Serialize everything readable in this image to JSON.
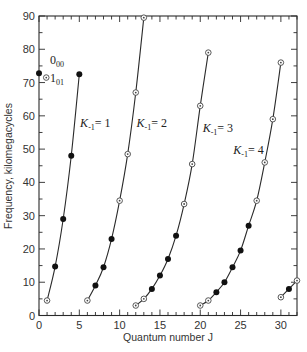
{
  "chart_data": {
    "type": "line",
    "title": "",
    "xlabel": "Quantum number J",
    "ylabel": "Frequency, kilomegacycles",
    "xlim": [
      0,
      32
    ],
    "ylim": [
      0,
      90
    ],
    "grid": false,
    "x_ticks": [
      0,
      5,
      10,
      15,
      20,
      25,
      30
    ],
    "y_ticks": [
      0,
      10,
      20,
      30,
      40,
      50,
      60,
      70,
      80,
      90
    ],
    "marker_legend": {
      "filled": "filled circle",
      "open": "open (dotted) circle"
    },
    "annotations": [
      {
        "text": "0",
        "sub": "00",
        "x": 0,
        "y": 72.8,
        "marker": "filled"
      },
      {
        "text": "1",
        "sub": "01",
        "x": 0.9,
        "y": 71.5,
        "marker": "open"
      }
    ],
    "series": [
      {
        "name": "K_-1 = 1",
        "label_base": "K",
        "label_sub": "-1",
        "label_value": "= 1",
        "label_pos": [
          5.1,
          56.5
        ],
        "points": [
          {
            "x": 1,
            "y": 4.5,
            "m": "open"
          },
          {
            "x": 2,
            "y": 14.7,
            "m": "filled"
          },
          {
            "x": 3,
            "y": 29,
            "m": "filled"
          },
          {
            "x": 4,
            "y": 48,
            "m": "filled"
          },
          {
            "x": 5,
            "y": 72.5,
            "m": "filled"
          }
        ]
      },
      {
        "name": "K_-1 = 2",
        "label_base": "K",
        "label_sub": "-1",
        "label_value": "= 2",
        "label_pos": [
          12.1,
          56.5
        ],
        "points": [
          {
            "x": 6,
            "y": 4.5,
            "m": "open"
          },
          {
            "x": 7,
            "y": 9,
            "m": "filled"
          },
          {
            "x": 8,
            "y": 14.5,
            "m": "filled"
          },
          {
            "x": 9,
            "y": 23,
            "m": "filled"
          },
          {
            "x": 10,
            "y": 34.5,
            "m": "open"
          },
          {
            "x": 11,
            "y": 48.5,
            "m": "open"
          },
          {
            "x": 12,
            "y": 67,
            "m": "open"
          },
          {
            "x": 13,
            "y": 89.5,
            "m": "open"
          }
        ]
      },
      {
        "name": "K_-1 = 3",
        "label_base": "K",
        "label_sub": "-1",
        "label_value": "= 3",
        "label_pos": [
          20.3,
          55
        ],
        "points": [
          {
            "x": 12,
            "y": 3,
            "m": "open"
          },
          {
            "x": 13,
            "y": 5,
            "m": "open"
          },
          {
            "x": 14,
            "y": 8,
            "m": "filled"
          },
          {
            "x": 15,
            "y": 12,
            "m": "filled"
          },
          {
            "x": 16,
            "y": 17,
            "m": "filled"
          },
          {
            "x": 17,
            "y": 24,
            "m": "filled"
          },
          {
            "x": 18,
            "y": 33.5,
            "m": "open"
          },
          {
            "x": 19,
            "y": 45.5,
            "m": "open"
          },
          {
            "x": 20,
            "y": 63,
            "m": "open"
          },
          {
            "x": 21,
            "y": 79,
            "m": "open"
          }
        ]
      },
      {
        "name": "K_-1 = 4",
        "label_base": "K",
        "label_sub": "-1",
        "label_value": "= 4",
        "label_pos": [
          24.1,
          48.5
        ],
        "points": [
          {
            "x": 20,
            "y": 3,
            "m": "open"
          },
          {
            "x": 21,
            "y": 4.5,
            "m": "open"
          },
          {
            "x": 22,
            "y": 7,
            "m": "filled"
          },
          {
            "x": 23,
            "y": 10,
            "m": "filled"
          },
          {
            "x": 24,
            "y": 14.5,
            "m": "filled"
          },
          {
            "x": 25,
            "y": 19.5,
            "m": "filled"
          },
          {
            "x": 26,
            "y": 27,
            "m": "filled"
          },
          {
            "x": 27,
            "y": 34.5,
            "m": "open"
          },
          {
            "x": 28,
            "y": 46,
            "m": "open"
          },
          {
            "x": 29,
            "y": 59,
            "m": "open"
          },
          {
            "x": 30,
            "y": 76,
            "m": "open"
          }
        ]
      },
      {
        "name": "K_-1 = 5 (partial)",
        "label_base": "",
        "label_sub": "",
        "label_value": "",
        "label_pos": null,
        "points": [
          {
            "x": 30,
            "y": 5.5,
            "m": "open"
          },
          {
            "x": 31,
            "y": 8,
            "m": "filled"
          },
          {
            "x": 32,
            "y": 10.5,
            "m": "open"
          }
        ]
      }
    ]
  }
}
